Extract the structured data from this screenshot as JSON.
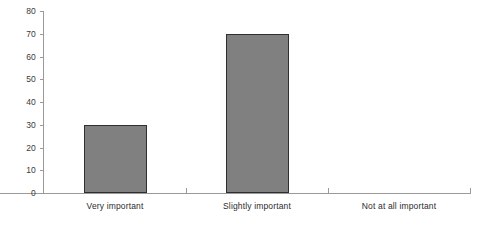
{
  "chart_data": {
    "type": "bar",
    "title": "",
    "subtitle": "",
    "xlabel": "",
    "ylabel": "",
    "categories": [
      "Very important",
      "Slightly important",
      "Not at all important"
    ],
    "values": [
      30,
      70,
      0
    ],
    "ylim": [
      0,
      80
    ],
    "yticks": [
      0,
      10,
      20,
      30,
      40,
      50,
      60,
      70,
      80
    ],
    "ytick_labels": [
      "0",
      "10",
      "20",
      "30",
      "40",
      "50",
      "60",
      "70",
      "80"
    ],
    "grid": false,
    "legend": null,
    "legend_position": "none",
    "bar_fill_color": "#808080",
    "bar_border_color": "#2f2f2f",
    "axis_color": "#9a9a9a",
    "text_color": "#2b2b2b",
    "background_color": "#ffffff"
  }
}
